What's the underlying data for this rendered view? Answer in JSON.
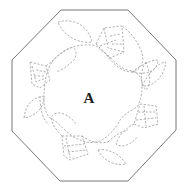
{
  "diagram": {
    "type": "quilting-pattern",
    "shape": "octagon",
    "center_label": "A",
    "label_position": {
      "x": 89,
      "y": 98
    },
    "outline_color": "#777777",
    "stitch_color": "#a8a8a8",
    "octagon_points": "61,10 128,10 176,60 176,130 128,181 60,181 12,131 12,60",
    "motifs": [
      {
        "name": "tulip-top",
        "angle": 0
      },
      {
        "name": "tulip-right",
        "angle": 90
      },
      {
        "name": "tulip-bottom",
        "angle": 180
      },
      {
        "name": "tulip-left",
        "angle": 270
      }
    ]
  }
}
